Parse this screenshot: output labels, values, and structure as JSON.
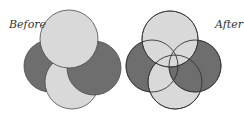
{
  "labels": {
    "before": "Before",
    "after": "After"
  },
  "colors": {
    "light": "#d9d9d9",
    "dark": "#6e6e6e",
    "stroke": "#4a4a4a",
    "text": "#333333"
  },
  "before": {
    "circles": [
      {
        "name": "left-dark",
        "cx": 50,
        "cy": 66,
        "r": 26,
        "tone": "dark"
      },
      {
        "name": "bottom-light",
        "cx": 72,
        "cy": 82,
        "r": 27,
        "tone": "light"
      },
      {
        "name": "right-dark",
        "cx": 94,
        "cy": 68,
        "r": 27,
        "tone": "dark"
      },
      {
        "name": "top-light",
        "cx": 69,
        "cy": 39,
        "r": 29,
        "tone": "light"
      }
    ]
  },
  "after": {
    "circles": [
      {
        "name": "left-dark",
        "cx": 152,
        "cy": 66,
        "r": 26,
        "tone": "dark"
      },
      {
        "name": "bottom-light",
        "cx": 175,
        "cy": 82,
        "r": 27,
        "tone": "light"
      },
      {
        "name": "right-dark",
        "cx": 195,
        "cy": 66,
        "r": 26,
        "tone": "dark"
      },
      {
        "name": "top-light",
        "cx": 170,
        "cy": 39,
        "r": 28,
        "tone": "light"
      }
    ]
  }
}
